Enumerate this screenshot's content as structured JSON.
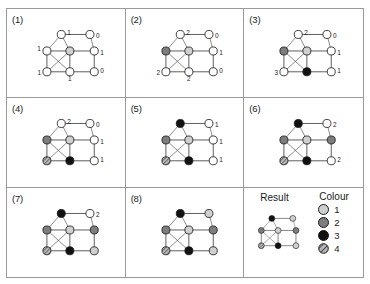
{
  "figure": {
    "legend_title": "Colour",
    "result_title": "Result",
    "colors": {
      "colour1": "#cfcfcf",
      "colour2": "#7d7d7d",
      "colour3": "#111111",
      "colour4_hatch": "#8a8a8a",
      "uncolored": "#ffffff",
      "edge": "#4d4d4d",
      "outline": "#1a1a1a"
    },
    "legend_items": [
      {
        "swatch": "colour1",
        "label": "1"
      },
      {
        "swatch": "colour2",
        "label": "2"
      },
      {
        "swatch": "colour3",
        "label": "3"
      },
      {
        "swatch": "colour4",
        "label": "4"
      }
    ]
  },
  "graph": {
    "node_ids": [
      "TL",
      "TR",
      "ML",
      "MC",
      "MR",
      "BL",
      "BC",
      "BR"
    ],
    "edges": [
      [
        "TL",
        "TR"
      ],
      [
        "TL",
        "ML"
      ],
      [
        "TL",
        "MC"
      ],
      [
        "TR",
        "MR"
      ],
      [
        "ML",
        "MC"
      ],
      [
        "MC",
        "MR"
      ],
      [
        "ML",
        "BL"
      ],
      [
        "ML",
        "BC"
      ],
      [
        "MC",
        "BL"
      ],
      [
        "MC",
        "BC"
      ],
      [
        "MR",
        "BR"
      ],
      [
        "BL",
        "BC"
      ],
      [
        "BC",
        "BR"
      ]
    ]
  },
  "panels": [
    {
      "id": "panel-1",
      "label": "(1)",
      "nodes": {
        "TL": {
          "state": "uncolored",
          "label": "1"
        },
        "TR": {
          "state": "uncolored",
          "label": "0"
        },
        "ML": {
          "state": "uncolored",
          "label": "1"
        },
        "MC": {
          "state": "colour1",
          "label": ""
        },
        "MR": {
          "state": "uncolored",
          "label": "1"
        },
        "BL": {
          "state": "uncolored",
          "label": "1"
        },
        "BC": {
          "state": "uncolored",
          "label": "1"
        },
        "BR": {
          "state": "uncolored",
          "label": "0"
        }
      }
    },
    {
      "id": "panel-2",
      "label": "(2)",
      "nodes": {
        "TL": {
          "state": "uncolored",
          "label": "2"
        },
        "TR": {
          "state": "uncolored",
          "label": "0"
        },
        "ML": {
          "state": "colour2",
          "label": ""
        },
        "MC": {
          "state": "colour1",
          "label": ""
        },
        "MR": {
          "state": "uncolored",
          "label": "1"
        },
        "BL": {
          "state": "uncolored",
          "label": "2"
        },
        "BC": {
          "state": "uncolored",
          "label": "2"
        },
        "BR": {
          "state": "uncolored",
          "label": "0"
        }
      }
    },
    {
      "id": "panel-3",
      "label": "(3)",
      "nodes": {
        "TL": {
          "state": "uncolored",
          "label": "2"
        },
        "TR": {
          "state": "uncolored",
          "label": "0"
        },
        "ML": {
          "state": "colour2",
          "label": ""
        },
        "MC": {
          "state": "colour1",
          "label": ""
        },
        "MR": {
          "state": "uncolored",
          "label": "1"
        },
        "BL": {
          "state": "uncolored",
          "label": "3"
        },
        "BC": {
          "state": "colour3",
          "label": ""
        },
        "BR": {
          "state": "uncolored",
          "label": "1"
        }
      }
    },
    {
      "id": "panel-4",
      "label": "(4)",
      "nodes": {
        "TL": {
          "state": "uncolored",
          "label": "2"
        },
        "TR": {
          "state": "uncolored",
          "label": "0"
        },
        "ML": {
          "state": "colour2",
          "label": ""
        },
        "MC": {
          "state": "colour1",
          "label": ""
        },
        "MR": {
          "state": "uncolored",
          "label": "1"
        },
        "BL": {
          "state": "colour4",
          "label": ""
        },
        "BC": {
          "state": "colour3",
          "label": ""
        },
        "BR": {
          "state": "uncolored",
          "label": "1"
        }
      }
    },
    {
      "id": "panel-5",
      "label": "(5)",
      "nodes": {
        "TL": {
          "state": "colour3",
          "label": ""
        },
        "TR": {
          "state": "uncolored",
          "label": "1"
        },
        "ML": {
          "state": "colour2",
          "label": ""
        },
        "MC": {
          "state": "colour1",
          "label": ""
        },
        "MR": {
          "state": "uncolored",
          "label": "1"
        },
        "BL": {
          "state": "colour4",
          "label": ""
        },
        "BC": {
          "state": "colour3",
          "label": ""
        },
        "BR": {
          "state": "uncolored",
          "label": "1"
        }
      }
    },
    {
      "id": "panel-6",
      "label": "(6)",
      "nodes": {
        "TL": {
          "state": "colour3",
          "label": ""
        },
        "TR": {
          "state": "uncolored",
          "label": "2"
        },
        "ML": {
          "state": "colour2",
          "label": ""
        },
        "MC": {
          "state": "colour1",
          "label": ""
        },
        "MR": {
          "state": "colour2",
          "label": ""
        },
        "BL": {
          "state": "colour4",
          "label": ""
        },
        "BC": {
          "state": "colour3",
          "label": ""
        },
        "BR": {
          "state": "uncolored",
          "label": "2"
        }
      }
    },
    {
      "id": "panel-7",
      "label": "(7)",
      "nodes": {
        "TL": {
          "state": "colour3",
          "label": ""
        },
        "TR": {
          "state": "uncolored",
          "label": "2"
        },
        "ML": {
          "state": "colour2",
          "label": ""
        },
        "MC": {
          "state": "colour1",
          "label": ""
        },
        "MR": {
          "state": "colour2",
          "label": ""
        },
        "BL": {
          "state": "colour4",
          "label": ""
        },
        "BC": {
          "state": "colour3",
          "label": ""
        },
        "BR": {
          "state": "colour1",
          "label": ""
        }
      }
    },
    {
      "id": "panel-8",
      "label": "(8)",
      "nodes": {
        "TL": {
          "state": "colour3",
          "label": ""
        },
        "TR": {
          "state": "colour1",
          "label": ""
        },
        "ML": {
          "state": "colour2",
          "label": ""
        },
        "MC": {
          "state": "colour1",
          "label": ""
        },
        "MR": {
          "state": "colour2",
          "label": ""
        },
        "BL": {
          "state": "colour4",
          "label": ""
        },
        "BC": {
          "state": "colour3",
          "label": ""
        },
        "BR": {
          "state": "colour1",
          "label": ""
        }
      }
    },
    {
      "id": "panel-result",
      "label": "",
      "nodes": {
        "TL": {
          "state": "colour3",
          "label": ""
        },
        "TR": {
          "state": "colour1",
          "label": ""
        },
        "ML": {
          "state": "colour2",
          "label": ""
        },
        "MC": {
          "state": "colour1",
          "label": ""
        },
        "MR": {
          "state": "colour2",
          "label": ""
        },
        "BL": {
          "state": "colour4",
          "label": ""
        },
        "BC": {
          "state": "colour3",
          "label": ""
        },
        "BR": {
          "state": "colour1",
          "label": ""
        }
      }
    }
  ]
}
